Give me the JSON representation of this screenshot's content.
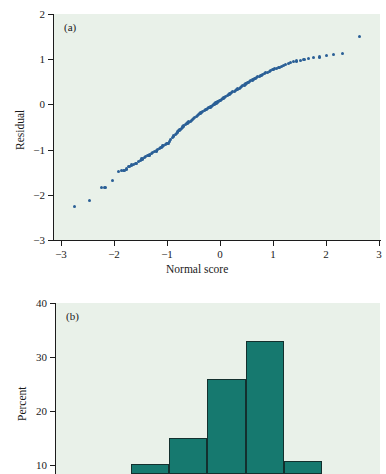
{
  "figure": {
    "background": "#ffffff",
    "plot_background": "#e9f1e9",
    "scatter_color": "#2a5f96",
    "bar_color": "#16796f",
    "bar_edge_color": "#13302e",
    "axis_color": "#1c1c1c"
  },
  "panel_a": {
    "tag": "(a)",
    "xlabel": "Normal score",
    "ylabel": "Residual",
    "xticks": [
      "−3",
      "−2",
      "−1",
      "0",
      "1",
      "2",
      "3"
    ],
    "yticks": [
      "2",
      "1",
      "0",
      "−1",
      "−2",
      "−3"
    ]
  },
  "panel_b": {
    "tag": "(b)",
    "ylabel": "Percent",
    "yticks": [
      "40",
      "30",
      "20",
      "10"
    ]
  },
  "chart_data": [
    {
      "type": "scatter",
      "title": "(a)",
      "xlabel": "Normal score",
      "ylabel": "Residual",
      "xlim": [
        -3,
        3
      ],
      "ylim": [
        -3,
        2
      ],
      "xticks": [
        -3,
        -2,
        -1,
        0,
        1,
        2,
        3
      ],
      "yticks": [
        -3,
        -2,
        -1,
        0,
        1,
        2
      ],
      "grid": false,
      "legend": "none",
      "series": [
        {
          "name": "Normal probability plot of residuals",
          "x": [
            -2.62,
            -2.34,
            -2.12,
            -2.06,
            -1.93,
            -1.82,
            -1.76,
            -1.71,
            -1.66,
            -1.62,
            -1.57,
            -1.53,
            -1.49,
            -1.45,
            -1.41,
            -1.38,
            -1.34,
            -1.31,
            -1.27,
            -1.24,
            -1.21,
            -1.18,
            -1.15,
            -1.12,
            -1.09,
            -1.06,
            -1.03,
            -1.0,
            -0.98,
            -0.95,
            -0.92,
            -0.9,
            -0.87,
            -0.85,
            -0.82,
            -0.8,
            -0.77,
            -0.75,
            -0.72,
            -0.7,
            -0.68,
            -0.65,
            -0.63,
            -0.61,
            -0.58,
            -0.56,
            -0.54,
            -0.52,
            -0.49,
            -0.47,
            -0.45,
            -0.43,
            -0.41,
            -0.38,
            -0.36,
            -0.34,
            -0.32,
            -0.3,
            -0.28,
            -0.26,
            -0.23,
            -0.21,
            -0.19,
            -0.17,
            -0.15,
            -0.13,
            -0.11,
            -0.09,
            -0.07,
            -0.05,
            -0.02,
            0.0,
            0.02,
            0.04,
            0.06,
            0.08,
            0.1,
            0.12,
            0.14,
            0.16,
            0.19,
            0.21,
            0.23,
            0.25,
            0.27,
            0.29,
            0.32,
            0.34,
            0.36,
            0.38,
            0.41,
            0.43,
            0.45,
            0.47,
            0.5,
            0.52,
            0.55,
            0.57,
            0.6,
            0.62,
            0.65,
            0.67,
            0.7,
            0.73,
            0.75,
            0.78,
            0.81,
            0.84,
            0.87,
            0.9,
            0.93,
            0.96,
            0.99,
            1.03,
            1.06,
            1.1,
            1.14,
            1.18,
            1.22,
            1.26,
            1.31,
            1.36,
            1.41,
            1.47,
            1.53,
            1.6,
            1.68,
            1.77,
            1.88,
            2.01,
            2.14,
            2.31,
            2.63
          ],
          "y": [
            -2.26,
            -2.12,
            -1.84,
            -1.83,
            -1.68,
            -1.49,
            -1.47,
            -1.46,
            -1.43,
            -1.38,
            -1.34,
            -1.33,
            -1.3,
            -1.27,
            -1.24,
            -1.21,
            -1.18,
            -1.15,
            -1.13,
            -1.12,
            -1.09,
            -1.07,
            -1.05,
            -1.03,
            -0.99,
            -0.98,
            -0.96,
            -0.92,
            -0.91,
            -0.89,
            -0.87,
            -0.86,
            -0.82,
            -0.78,
            -0.74,
            -0.7,
            -0.67,
            -0.64,
            -0.61,
            -0.58,
            -0.55,
            -0.53,
            -0.5,
            -0.48,
            -0.45,
            -0.43,
            -0.41,
            -0.39,
            -0.37,
            -0.35,
            -0.33,
            -0.31,
            -0.29,
            -0.27,
            -0.25,
            -0.23,
            -0.21,
            -0.19,
            -0.18,
            -0.16,
            -0.14,
            -0.12,
            -0.11,
            -0.09,
            -0.07,
            -0.06,
            -0.04,
            -0.02,
            -0.01,
            0.01,
            0.03,
            0.04,
            0.06,
            0.08,
            0.09,
            0.11,
            0.13,
            0.14,
            0.16,
            0.18,
            0.19,
            0.21,
            0.23,
            0.24,
            0.26,
            0.28,
            0.29,
            0.31,
            0.33,
            0.34,
            0.36,
            0.38,
            0.4,
            0.41,
            0.43,
            0.45,
            0.47,
            0.48,
            0.5,
            0.52,
            0.54,
            0.55,
            0.57,
            0.59,
            0.61,
            0.62,
            0.64,
            0.66,
            0.68,
            0.7,
            0.71,
            0.73,
            0.75,
            0.77,
            0.79,
            0.8,
            0.82,
            0.84,
            0.86,
            0.88,
            0.9,
            0.92,
            0.94,
            0.96,
            0.98,
            1.0,
            1.01,
            1.03,
            1.05,
            1.08,
            1.1,
            1.12,
            1.51
          ]
        }
      ]
    },
    {
      "type": "bar",
      "title": "(b)",
      "xlabel": "",
      "ylabel": "Percent",
      "ylim": [
        0,
        40
      ],
      "yticks": [
        10,
        20,
        30,
        40
      ],
      "grid": false,
      "legend": "none",
      "note": "Histogram of residuals; lower portion of panel is cropped by the image edge.",
      "categories": [
        "bin 1",
        "bin 2",
        "bin 3",
        "bin 4",
        "bin 5"
      ],
      "values": [
        10.2,
        15.0,
        26.0,
        33.0,
        10.8
      ]
    }
  ]
}
